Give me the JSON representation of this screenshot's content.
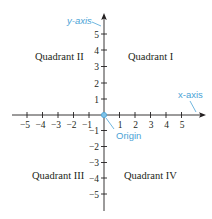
{
  "diagram": {
    "colors": {
      "axis": "#231f20",
      "accent": "#4ba3d6"
    },
    "quadrants": {
      "q1": "Quadrant I",
      "q2": "Quadrant II",
      "q3": "Quadrant III",
      "q4": "Quadrant IV"
    },
    "callouts": {
      "y_axis": "y-axis",
      "x_axis": "x-axis",
      "origin": "Origin"
    },
    "x_ticks": {
      "neg5": "−5",
      "neg4": "−4",
      "neg3": "−3",
      "neg2": "−2",
      "neg1": "−1",
      "pos1": "1",
      "pos2": "2",
      "pos3": "3",
      "pos4": "4",
      "pos5": "5"
    },
    "y_ticks": {
      "pos5": "5",
      "pos4": "4",
      "pos3": "3",
      "pos2": "2",
      "pos1": "1",
      "neg1": "−1",
      "neg2": "−2",
      "neg3": "−3",
      "neg4": "−4",
      "neg5": "−5"
    }
  }
}
